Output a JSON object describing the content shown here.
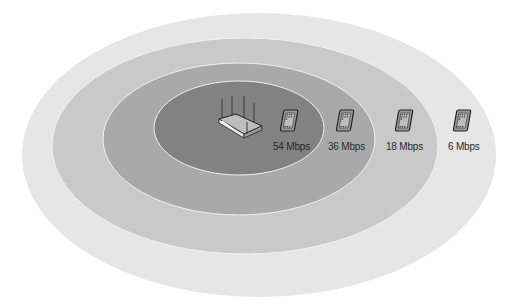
{
  "diagram": {
    "zones": [
      {
        "name": "zone-6",
        "rate": "6 Mbps",
        "color": "#e6e6e6"
      },
      {
        "name": "zone-18",
        "rate": "18 Mbps",
        "color": "#c9c9c9"
      },
      {
        "name": "zone-36",
        "rate": "36 Mbps",
        "color": "#a9a9a9"
      },
      {
        "name": "zone-54",
        "rate": "54 Mbps",
        "color": "#828282"
      }
    ],
    "access_point": {
      "icon": "wireless-router-icon"
    },
    "clients": [
      {
        "label": "54 Mbps",
        "icon": "tablet-icon"
      },
      {
        "label": "36 Mbps",
        "icon": "tablet-icon"
      },
      {
        "label": "18 Mbps",
        "icon": "tablet-icon"
      },
      {
        "label": "6 Mbps",
        "icon": "tablet-icon"
      }
    ]
  }
}
